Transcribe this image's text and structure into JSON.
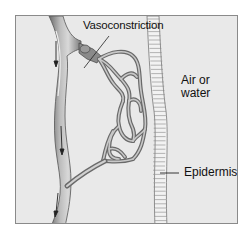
{
  "diagram": {
    "labels": {
      "vasoconstriction": "Vasoconstriction",
      "air_line1": "Air or",
      "air_line2": "water",
      "epidermis": "Epidermis"
    },
    "colors": {
      "background": "#e9e9e9",
      "frame_border": "#8a8a8a",
      "vessel_fill": "#a9a9a9",
      "vessel_dark": "#5a5a5a",
      "vessel_highlight": "#d6d6d6",
      "epidermis_fill": "#f2f2f2",
      "epidermis_stroke": "#777777",
      "text": "#111111"
    },
    "elements": [
      {
        "name": "main-blood-vessel",
        "description": "vertical vessel with downward flow arrows"
      },
      {
        "name": "constricted-arteriole",
        "description": "branch with constriction band feeding capillary bed"
      },
      {
        "name": "capillary-network",
        "description": "meshwork of capillaries near epidermis"
      },
      {
        "name": "return-vessel",
        "description": "branch returning to main vessel"
      },
      {
        "name": "epidermis-layer",
        "description": "wavy ladder-like strip"
      }
    ],
    "flow_arrows": 3
  }
}
